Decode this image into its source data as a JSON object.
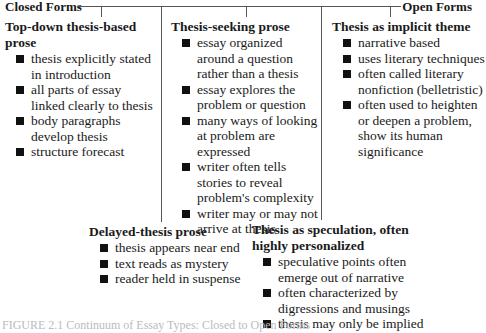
{
  "spectrum": {
    "left_label": "Closed Forms",
    "right_label": "Open Forms"
  },
  "categories": [
    {
      "id": "top-down",
      "title": "Top-down thesis-based prose",
      "items": [
        "thesis explicitly stated in introduction",
        "all parts of essay linked clearly to thesis",
        "body paragraphs develop thesis",
        "structure forecast"
      ]
    },
    {
      "id": "delayed",
      "title": "Delayed-thesis prose",
      "items": [
        "thesis appears near end",
        "text reads as mystery",
        "reader held in suspense"
      ]
    },
    {
      "id": "seeking",
      "title": "Thesis-seeking prose",
      "items": [
        "essay organized around a question rather than a thesis",
        "essay explores the problem or question",
        "many ways of looking at problem are expressed",
        "writer often tells stories to reveal problem's complexity",
        "writer may or may not arrive at thesis"
      ]
    },
    {
      "id": "speculation",
      "title": "Thesis as speculation, often highly personalized",
      "items": [
        "speculative points often emerge out of narrative",
        "often characterized by digressions and musings",
        "thesis may only be implied"
      ]
    },
    {
      "id": "implicit",
      "title": "Thesis as implicit theme",
      "items": [
        "narrative based",
        "uses literary techniques",
        "often called literary nonfiction (belletristic)",
        "often used to heighten or deepen a problem, show its human significance"
      ]
    }
  ],
  "caption": "FIGURE 2.1  Continuum of Essay Types: Closed to Open Forms"
}
